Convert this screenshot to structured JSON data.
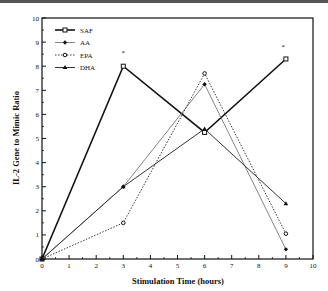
{
  "chart_data": {
    "type": "line",
    "title": "",
    "xlabel": "Stimulation Time (hours)",
    "ylabel": "IL-2 Gene to Mimic Ratio",
    "xlim": [
      0,
      10
    ],
    "ylim": [
      0,
      10
    ],
    "xticks": [
      "0",
      "1",
      "2",
      "3",
      "4",
      "5",
      "6",
      "7",
      "8",
      "9",
      "10"
    ],
    "yticks": [
      "0",
      "1",
      "2",
      "3",
      "4",
      "5",
      "6",
      "7",
      "8",
      "9",
      "10"
    ],
    "grid": false,
    "legend_position": "top-left",
    "x": [
      0,
      3,
      6,
      9
    ],
    "series": [
      {
        "name": "SAF",
        "values": [
          0,
          8.0,
          5.25,
          8.3
        ],
        "style": "solid-thick",
        "marker": "open-square"
      },
      {
        "name": "AA",
        "values": [
          0,
          3.0,
          7.25,
          0.4
        ],
        "style": "solid-thin",
        "marker": "diamond"
      },
      {
        "name": "EPA",
        "values": [
          0,
          1.5,
          7.7,
          1.05
        ],
        "style": "dotted",
        "marker": "open-circle"
      },
      {
        "name": "DHA",
        "values": [
          0,
          3.0,
          5.4,
          2.3
        ],
        "style": "solid-medium",
        "marker": "triangle"
      }
    ],
    "annotations": [
      {
        "text": "*",
        "x": 3,
        "y": 8.6
      },
      {
        "text": "*",
        "x": 8.9,
        "y": 8.85
      }
    ]
  }
}
